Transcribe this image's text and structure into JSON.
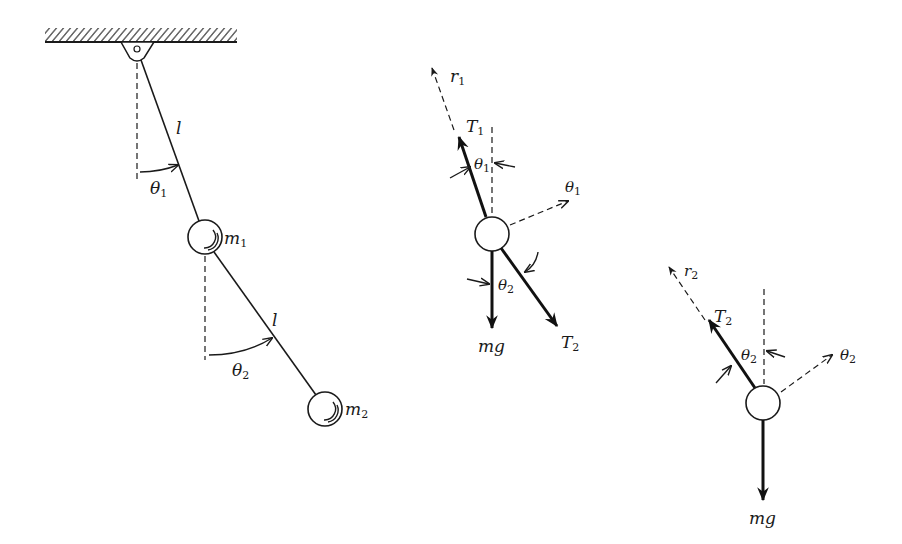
{
  "figure": {
    "pendulum": {
      "rod1_label": "l",
      "rod2_label": "l",
      "angle1_label": "θ",
      "angle1_sub": "1",
      "angle2_label": "θ",
      "angle2_sub": "2",
      "mass1_label": "m",
      "mass1_sub": "1",
      "mass2_label": "m",
      "mass2_sub": "2"
    },
    "fbd_mass1": {
      "radial_label": "r",
      "radial_sub": "1",
      "tension_up_label": "T",
      "tension_up_sub": "1",
      "angle_label": "θ",
      "angle_sub": "1",
      "tangential_label": "θ",
      "tangential_sub": "1",
      "lower_angle_label": "θ",
      "lower_angle_sub": "2",
      "weight_label": "mg",
      "tension_down_label": "T",
      "tension_down_sub": "2"
    },
    "fbd_mass2": {
      "radial_label": "r",
      "radial_sub": "2",
      "tension_label": "T",
      "tension_sub": "2",
      "angle_label": "θ",
      "angle_sub": "2",
      "tangential_label": "θ",
      "tangential_sub": "2",
      "weight_label": "mg"
    }
  }
}
